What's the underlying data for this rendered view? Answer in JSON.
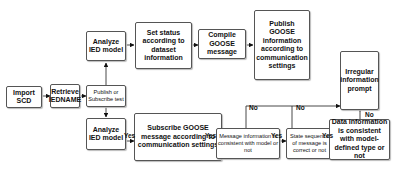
{
  "diagram": {
    "nodes": {
      "import_scd": "Import SCD",
      "retrieve_iedname": "Retrieve IEDNAME",
      "publish_or_subscribe": "Publish or Subscribe test",
      "analyze_ied_top": "Analyze IED model",
      "set_status": "Set status according to dataset information",
      "compile_goose": "Compile GOOSE message",
      "publish_goose": "Publish GOOSE information according to communication settings",
      "irregular_prompt": "Irregular information prompt",
      "analyze_ied_bottom": "Analyze IED model",
      "subscribe_goose": "Subscribe GOOSE message according to communication settings",
      "message_consistent": "Message information is consistent with model or not",
      "state_sequence": "State sequence of message is correct or not",
      "data_consistent": "Data information is consistent with model-defined type or not"
    },
    "edge_labels": {
      "yes1": "Yes",
      "yes2": "Yes",
      "yes3": "Yes",
      "yes4": "Yes",
      "no1": "No",
      "no2": "No",
      "no3": "No"
    }
  }
}
